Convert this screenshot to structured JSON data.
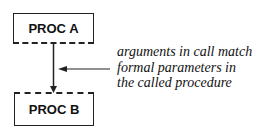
{
  "diagram": {
    "nodes": [
      {
        "id": "proc_a",
        "label": "PROC A"
      },
      {
        "id": "proc_b",
        "label": "PROC B"
      }
    ],
    "edges": [
      {
        "from": "proc_a",
        "to": "proc_b",
        "style": "solid-arrow"
      }
    ],
    "annotation": {
      "lines": [
        "arguments in call match",
        "formal parameters in",
        "the called procedure"
      ],
      "points_to": "edge proc_a -> proc_b"
    }
  }
}
